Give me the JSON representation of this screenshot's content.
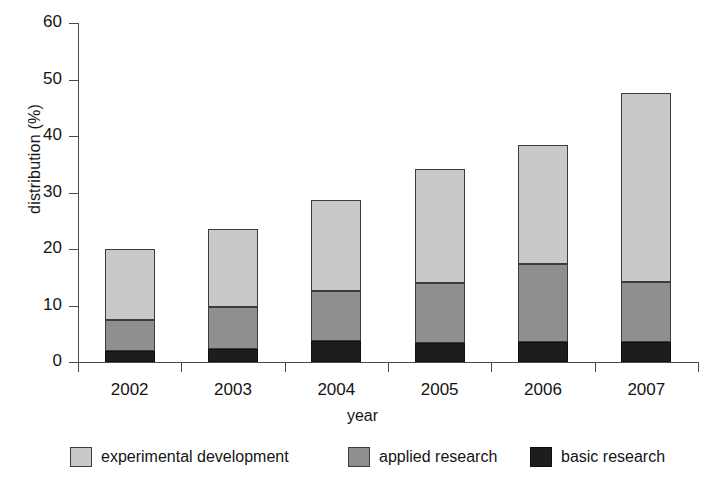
{
  "chart_data": {
    "type": "bar",
    "subtype": "stacked-bar",
    "title": "",
    "xlabel": "year",
    "ylabel": "distribution (%)",
    "categories": [
      "2002",
      "2003",
      "2004",
      "2005",
      "2006",
      "2007"
    ],
    "series": [
      {
        "name": "basic research",
        "color": "#1d1d1d",
        "values": [
          2.0,
          2.3,
          3.8,
          3.3,
          3.5,
          3.6
        ]
      },
      {
        "name": "applied research",
        "color": "#8f8f8f",
        "values": [
          5.5,
          7.4,
          8.7,
          10.6,
          13.9,
          10.6
        ]
      },
      {
        "name": "experimental development",
        "color": "#c9c9c9",
        "values": [
          12.5,
          13.8,
          16.2,
          20.3,
          21.0,
          33.5
        ]
      }
    ],
    "cumulative_tops": {
      "basic research": [
        2.0,
        2.3,
        3.8,
        3.3,
        3.5,
        3.6
      ],
      "applied research": [
        7.5,
        9.7,
        12.5,
        13.9,
        17.4,
        14.2
      ],
      "experimental development": [
        20.0,
        23.5,
        28.7,
        34.2,
        38.4,
        47.7
      ]
    },
    "totals": [
      20.0,
      23.5,
      28.7,
      34.2,
      38.4,
      47.7
    ],
    "ylim": [
      0,
      60
    ],
    "yticks": [
      0,
      10,
      20,
      30,
      40,
      50,
      60
    ],
    "ytick_labels": [
      "0",
      "10",
      "20",
      "30",
      "40",
      "50",
      "60"
    ],
    "grid": false,
    "legend_position": "bottom",
    "stack_order_bottom_to_top": [
      "basic research",
      "applied research",
      "experimental development"
    ]
  },
  "legend": {
    "items": [
      {
        "label": "experimental development",
        "swatch_class": "sw-exp",
        "swatch_name": "legend-swatch-experimental-development"
      },
      {
        "label": "applied research",
        "swatch_class": "sw-app",
        "swatch_name": "legend-swatch-applied-research"
      },
      {
        "label": "basic research",
        "swatch_class": "sw-bas",
        "swatch_name": "legend-swatch-basic-research"
      }
    ]
  },
  "axes": {
    "y_title": "distribution (%)",
    "x_title": "year"
  }
}
